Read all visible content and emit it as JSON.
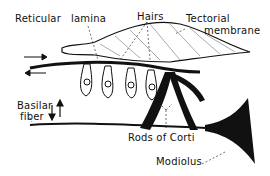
{
  "diagram": {
    "labels": {
      "reticular": "Reticular",
      "lamina": "lamina",
      "hairs": "Hairs",
      "tectorial_1": "Tectorial",
      "tectorial_2": "membrane",
      "basilar_1": "Basilar",
      "basilar_2": "fiber",
      "rods": "Rods of Corti",
      "modiolus": "Modiolus"
    },
    "colors": {
      "ink": "#111111",
      "background": "#ffffff"
    }
  }
}
